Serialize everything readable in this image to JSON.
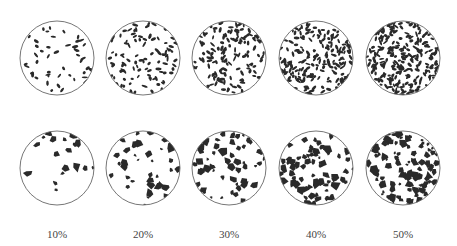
{
  "figure": {
    "colors": {
      "particle": "#2a2a2a",
      "outline": "#666666",
      "background": "#ffffff"
    },
    "columns": [
      {
        "label": "10%",
        "fraction": 0.1,
        "cx": 57
      },
      {
        "label": "20%",
        "fraction": 0.2,
        "cx": 143
      },
      {
        "label": "30%",
        "fraction": 0.3,
        "cx": 229
      },
      {
        "label": "40%",
        "fraction": 0.4,
        "cx": 316
      },
      {
        "label": "50%",
        "fraction": 0.5,
        "cx": 403
      }
    ],
    "rows": [
      {
        "name": "fine-particles",
        "cy": 58,
        "r": 37,
        "shape": "small elongated"
      },
      {
        "name": "coarse-particles",
        "cy": 168,
        "r": 37,
        "shape": "large irregular"
      }
    ]
  }
}
